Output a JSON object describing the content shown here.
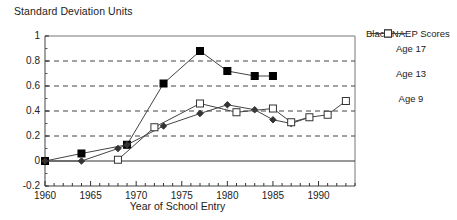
{
  "chart_data": {
    "type": "line",
    "title": "",
    "ylabel": "Standard Deviation Units",
    "xlabel": "Year of School Entry",
    "xlim": [
      1960,
      1994
    ],
    "ylim": [
      -0.2,
      1.0
    ],
    "y_ticks": [
      "1",
      "0.8",
      "0.6",
      "0.4",
      "0.2",
      "0",
      "-0.2"
    ],
    "y_tick_values": [
      1,
      0.8,
      0.6,
      0.4,
      0.2,
      0,
      -0.2
    ],
    "x_ticks": [
      "1960",
      "1965",
      "1970",
      "1975",
      "1980",
      "1985",
      "1990"
    ],
    "x_tick_values": [
      1960,
      1965,
      1970,
      1975,
      1980,
      1985,
      1990
    ],
    "x_minor_tick_interval": 1,
    "grid": "horizontal-dashed at 0.2, 0.4, 0.6, 0.8; solid zero line",
    "legend_position": "right",
    "legend_title": "Black NAEP Scores",
    "series": [
      {
        "name": "Age 17",
        "marker": "filled-square",
        "color": "#000000",
        "points": [
          {
            "x": 1960,
            "y": 0.0
          },
          {
            "x": 1964,
            "y": 0.06
          },
          {
            "x": 1969,
            "y": 0.13
          },
          {
            "x": 1973,
            "y": 0.62
          },
          {
            "x": 1977,
            "y": 0.88
          },
          {
            "x": 1980,
            "y": 0.72
          },
          {
            "x": 1983,
            "y": 0.68
          },
          {
            "x": 1985,
            "y": 0.68
          }
        ]
      },
      {
        "name": "Age 13",
        "marker": "small-diamond",
        "color": "#333333",
        "points": [
          {
            "x": 1960,
            "y": 0.0
          },
          {
            "x": 1964,
            "y": 0.0
          },
          {
            "x": 1968,
            "y": 0.1
          },
          {
            "x": 1969,
            "y": 0.13
          },
          {
            "x": 1973,
            "y": 0.28
          },
          {
            "x": 1977,
            "y": 0.38
          },
          {
            "x": 1980,
            "y": 0.45
          },
          {
            "x": 1983,
            "y": 0.41
          },
          {
            "x": 1985,
            "y": 0.33
          },
          {
            "x": 1987,
            "y": 0.3
          },
          {
            "x": 1989,
            "y": 0.35
          }
        ]
      },
      {
        "name": "Age 9",
        "marker": "open-square",
        "color": "#555555",
        "points": [
          {
            "x": 1968,
            "y": 0.01
          },
          {
            "x": 1972,
            "y": 0.27
          },
          {
            "x": 1977,
            "y": 0.46
          },
          {
            "x": 1981,
            "y": 0.39
          },
          {
            "x": 1985,
            "y": 0.42
          },
          {
            "x": 1987,
            "y": 0.31
          },
          {
            "x": 1989,
            "y": 0.35
          },
          {
            "x": 1991,
            "y": 0.37
          },
          {
            "x": 1993,
            "y": 0.48
          }
        ]
      }
    ]
  },
  "legend": {
    "title": "Black NAEP Scores",
    "entries": [
      {
        "label": "Age 17",
        "marker": "filled-square"
      },
      {
        "label": "Age 13",
        "marker": "small-diamond"
      },
      {
        "label": "Age 9",
        "marker": "open-square"
      }
    ]
  },
  "colors": {
    "axis": "#555555",
    "grid": "#444444",
    "background": "#ffffff",
    "text": "#222222"
  }
}
